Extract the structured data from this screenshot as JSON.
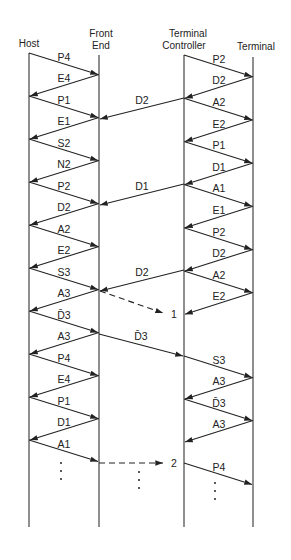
{
  "diagram": {
    "type": "message-sequence",
    "entities": [
      {
        "id": "host",
        "label": "Host",
        "x": 29
      },
      {
        "id": "front_end",
        "label_lines": [
          "Front",
          "End"
        ],
        "x": 99
      },
      {
        "id": "terminal_controller",
        "label_lines": [
          "Terminal",
          "Controller"
        ],
        "x": 184
      },
      {
        "id": "terminal",
        "label": "Terminal",
        "x": 253
      }
    ],
    "host_front_end_messages": [
      {
        "from": "host",
        "to": "front_end",
        "label": "P4"
      },
      {
        "from": "front_end",
        "to": "host",
        "label": "E4"
      },
      {
        "from": "host",
        "to": "front_end",
        "label": "P1"
      },
      {
        "from": "front_end",
        "to": "host",
        "label": "E1"
      },
      {
        "from": "host",
        "to": "front_end",
        "label": "S2"
      },
      {
        "from": "front_end",
        "to": "host",
        "label": "N2"
      },
      {
        "from": "host",
        "to": "front_end",
        "label": "P2"
      },
      {
        "from": "front_end",
        "to": "host",
        "label": "D2"
      },
      {
        "from": "host",
        "to": "front_end",
        "label": "A2"
      },
      {
        "from": "front_end",
        "to": "host",
        "label": "E2"
      },
      {
        "from": "host",
        "to": "front_end",
        "label": "S3"
      },
      {
        "from": "front_end",
        "to": "host",
        "label": "A3"
      },
      {
        "from": "host",
        "to": "front_end",
        "label": "D̄3"
      },
      {
        "from": "front_end",
        "to": "host",
        "label": "A3"
      },
      {
        "from": "host",
        "to": "front_end",
        "label": "P4"
      },
      {
        "from": "front_end",
        "to": "host",
        "label": "E4"
      },
      {
        "from": "host",
        "to": "front_end",
        "label": "P1"
      },
      {
        "from": "front_end",
        "to": "host",
        "label": "D1"
      },
      {
        "from": "host",
        "to": "front_end",
        "label": "A1"
      }
    ],
    "controller_terminal_messages": [
      {
        "from": "terminal_controller",
        "to": "terminal",
        "label": "P2"
      },
      {
        "from": "terminal",
        "to": "terminal_controller",
        "label": "D2"
      },
      {
        "from": "terminal_controller",
        "to": "terminal",
        "label": "A2"
      },
      {
        "from": "terminal",
        "to": "terminal_controller",
        "label": "E2"
      },
      {
        "from": "terminal_controller",
        "to": "terminal",
        "label": "P1"
      },
      {
        "from": "terminal",
        "to": "terminal_controller",
        "label": "D1"
      },
      {
        "from": "terminal_controller",
        "to": "terminal",
        "label": "A1"
      },
      {
        "from": "terminal",
        "to": "terminal_controller",
        "label": "E1"
      },
      {
        "from": "terminal_controller",
        "to": "terminal",
        "label": "P2"
      },
      {
        "from": "terminal",
        "to": "terminal_controller",
        "label": "D2"
      },
      {
        "from": "terminal_controller",
        "to": "terminal",
        "label": "A2"
      },
      {
        "from": "terminal",
        "to": "terminal_controller",
        "label": "E2"
      },
      {
        "from": "terminal_controller",
        "to": "terminal",
        "label": "S3"
      },
      {
        "from": "terminal",
        "to": "terminal_controller",
        "label": "A3"
      },
      {
        "from": "terminal_controller",
        "to": "terminal",
        "label": "D̄3"
      },
      {
        "from": "terminal",
        "to": "terminal_controller",
        "label": "A3"
      },
      {
        "from": "terminal_controller",
        "to": "terminal",
        "label": "P4"
      }
    ],
    "cross_messages": [
      {
        "from": "terminal_controller",
        "to": "front_end",
        "label": "D2",
        "style": "solid"
      },
      {
        "from": "terminal_controller",
        "to": "front_end",
        "label": "D1",
        "style": "solid"
      },
      {
        "from": "terminal_controller",
        "to": "front_end",
        "label": "D2",
        "style": "solid"
      },
      {
        "from": "front_end",
        "to": "terminal_controller",
        "label": "",
        "style": "dashed",
        "marker": "1"
      },
      {
        "from": "front_end",
        "to": "terminal_controller",
        "label": "D̄3",
        "style": "solid"
      },
      {
        "from": "front_end",
        "to": "terminal_controller",
        "label": "",
        "style": "dashed",
        "marker": "2"
      }
    ],
    "markers": [
      "1",
      "2"
    ],
    "continuation": "⋮"
  }
}
